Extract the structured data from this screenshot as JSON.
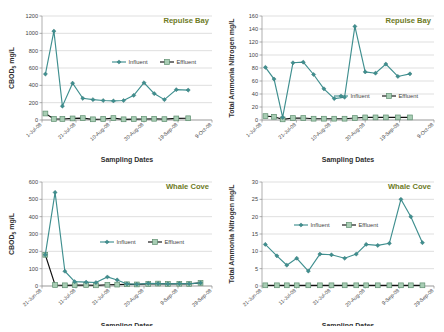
{
  "figure": {
    "panels": [
      "repulse-bay-cbod",
      "repulse-bay-tan",
      "whale-cove-cbod",
      "whale-cove-tan"
    ],
    "accent_title_color": "#6e7b1f",
    "influent_color": "#3f8f8f",
    "effluent_color": "#111111",
    "effluent_marker_fill": "#a8cdb4"
  },
  "chart_data": [
    {
      "id": "repulse-bay-cbod",
      "type": "line",
      "title": "Repulse Bay",
      "xlabel": "Sampling Dates",
      "ylabel": "CBOD5 mg/L",
      "ylabel_main": "CBOD",
      "ylabel_sub": "5",
      "ylabel_unit": " mg/L",
      "ylim": [
        0,
        1200
      ],
      "yticks": [
        0,
        200,
        400,
        600,
        800,
        1000,
        1200
      ],
      "xticks": [
        "1-Jul-08",
        "21-Jul-08",
        "10-Aug-08",
        "30-Aug-08",
        "19-Sep-08",
        "9-Oct-08"
      ],
      "xlim_days": [
        0,
        100
      ],
      "grid": true,
      "legend": [
        "Influent",
        "Effluent"
      ],
      "legend_position": "inside-upper-center",
      "series": [
        {
          "name": "Influent",
          "x": [
            2,
            7,
            12,
            18,
            24,
            30,
            36,
            42,
            48,
            54,
            60,
            66,
            72,
            79,
            86
          ],
          "values": [
            530,
            1025,
            160,
            425,
            250,
            235,
            225,
            220,
            225,
            285,
            430,
            305,
            235,
            350,
            345
          ]
        },
        {
          "name": "Effluent",
          "x": [
            2,
            7,
            12,
            18,
            24,
            30,
            36,
            42,
            48,
            54,
            60,
            66,
            72,
            79,
            86
          ],
          "values": [
            75,
            12,
            12,
            18,
            22,
            8,
            12,
            22,
            8,
            10,
            12,
            14,
            10,
            18,
            20
          ]
        }
      ]
    },
    {
      "id": "repulse-bay-tan",
      "type": "line",
      "title": "Repulse Bay",
      "xlabel": "Sampling Dates",
      "ylabel": "Total Ammonia Nitrogen mg/L",
      "ylim": [
        0,
        160
      ],
      "yticks": [
        0,
        20,
        40,
        60,
        80,
        100,
        120,
        140,
        160
      ],
      "xticks": [
        "1-Jul-08",
        "21-Jul-08",
        "10-Aug-08",
        "30-Aug-08",
        "19-Sep-08",
        "9-Oct-08"
      ],
      "xlim_days": [
        0,
        100
      ],
      "grid": true,
      "legend": [
        "Influent",
        "Effluent"
      ],
      "legend_position": "inside-lower-center",
      "series": [
        {
          "name": "Influent",
          "x": [
            2,
            7,
            12,
            18,
            24,
            30,
            36,
            42,
            48,
            54,
            60,
            66,
            72,
            79,
            86
          ],
          "values": [
            81,
            63,
            4,
            88,
            89,
            70,
            48,
            33,
            35,
            144,
            74,
            72,
            86,
            67,
            71
          ]
        },
        {
          "name": "Effluent",
          "x": [
            2,
            7,
            12,
            18,
            24,
            30,
            36,
            42,
            48,
            54,
            60,
            66,
            72,
            79,
            86
          ],
          "values": [
            6,
            5,
            1,
            3,
            3,
            2,
            2,
            2,
            2,
            3,
            4,
            4,
            4,
            4,
            4
          ]
        }
      ]
    },
    {
      "id": "whale-cove-cbod",
      "type": "line",
      "title": "Whale Cove",
      "xlabel": "Sampling Dates",
      "ylabel": "CBOD5 mg/L",
      "ylabel_main": "CBOD",
      "ylabel_sub": "5",
      "ylabel_unit": " mg/L",
      "ylim": [
        0,
        600
      ],
      "yticks": [
        0,
        100,
        200,
        300,
        400,
        500,
        600
      ],
      "xticks": [
        "21-Jun-08",
        "11-Jul-08",
        "31-Jul-08",
        "20-Aug-08",
        "9-Sep-08",
        "29-Sep-08"
      ],
      "xlim_days": [
        0,
        104
      ],
      "grid": true,
      "legend": [
        "Influent",
        "Effluent"
      ],
      "legend_position": "inside-center",
      "series": [
        {
          "name": "Influent",
          "x": [
            2,
            8,
            14,
            20,
            27,
            33,
            40,
            46,
            52,
            58,
            65,
            71,
            77,
            84,
            90,
            97
          ],
          "values": [
            180,
            540,
            85,
            25,
            22,
            20,
            52,
            35,
            12,
            10,
            15,
            14,
            12,
            14,
            13,
            18
          ]
        },
        {
          "name": "Effluent",
          "x": [
            2,
            8,
            14,
            20,
            27,
            33,
            40,
            46,
            52,
            58,
            65,
            71,
            77,
            84,
            90,
            97
          ],
          "values": [
            180,
            6,
            4,
            5,
            6,
            4,
            7,
            8,
            10,
            9,
            12,
            14,
            12,
            13,
            12,
            18
          ]
        }
      ]
    },
    {
      "id": "whale-cove-tan",
      "type": "line",
      "title": "Whale Cove",
      "xlabel": "Sampling Dates",
      "ylabel": "Total Ammonia Nitrogen mg/L",
      "ylim": [
        0,
        30
      ],
      "yticks": [
        0,
        5,
        10,
        15,
        20,
        25,
        30
      ],
      "xticks": [
        "21-Jun-08",
        "11-Jul-08",
        "31-Jul-08",
        "20-Aug-08",
        "9-Sep-08",
        "29-Sep-08"
      ],
      "xlim_days": [
        0,
        104
      ],
      "grid": true,
      "legend": [
        "Influent",
        "Effluent"
      ],
      "legend_position": "inside-upper-left",
      "series": [
        {
          "name": "Influent",
          "x": [
            2,
            9,
            15,
            21,
            28,
            35,
            42,
            50,
            57,
            63,
            70,
            77,
            84,
            90,
            97
          ],
          "values": [
            12.0,
            8.7,
            6.0,
            8.0,
            4.3,
            9.2,
            9.0,
            8.0,
            9.2,
            12.0,
            11.7,
            12.3,
            25.0,
            20.0,
            12.5
          ]
        },
        {
          "name": "Effluent",
          "x": [
            2,
            9,
            15,
            21,
            28,
            35,
            42,
            50,
            57,
            63,
            70,
            77,
            84,
            90,
            97
          ],
          "values": [
            0.2,
            0.2,
            0.2,
            0.2,
            0.2,
            0.2,
            0.2,
            0.2,
            0.2,
            0.2,
            0.2,
            0.2,
            0.2,
            0.2,
            0.2
          ]
        }
      ]
    }
  ]
}
